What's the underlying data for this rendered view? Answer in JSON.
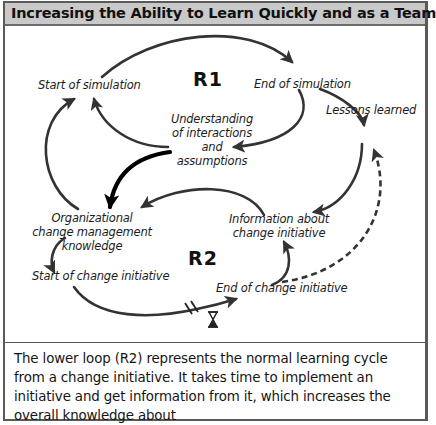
{
  "header": {
    "title": "Increasing the Ability to Learn Quickly and as a Team"
  },
  "diagram": {
    "loops": [
      {
        "id": "R1",
        "label": "R1",
        "type": "reinforcing"
      },
      {
        "id": "R2",
        "label": "R2",
        "type": "reinforcing"
      }
    ],
    "nodes": {
      "start_of_simulation": "Start of simulation",
      "end_of_simulation": "End of simulation",
      "understanding_line1": "Understanding",
      "understanding_line2": "of interactions",
      "understanding_line3": "and",
      "understanding_line4": "assumptions",
      "lessons_learned": "Lessons learned",
      "org_knowledge_line1": "Organizational",
      "org_knowledge_line2": "change management",
      "org_knowledge_line3": "knowledge",
      "information_line1": "Information about",
      "information_line2": "change initiative",
      "start_of_change": "Start of change initiative",
      "end_of_change": "End of change initiative"
    },
    "links": [
      {
        "from": "Start of simulation",
        "to": "End of simulation",
        "style": "solid"
      },
      {
        "from": "End of simulation",
        "to": "Understanding of interactions and assumptions",
        "style": "solid"
      },
      {
        "from": "Understanding of interactions and assumptions",
        "to": "Start of simulation",
        "style": "solid"
      },
      {
        "from": "End of simulation",
        "to": "Lessons learned",
        "style": "solid"
      },
      {
        "from": "Lessons learned",
        "to": "Information about change initiative",
        "style": "solid"
      },
      {
        "from": "Understanding of interactions and assumptions",
        "to": "Organizational change management knowledge",
        "style": "bold"
      },
      {
        "from": "Organizational change management knowledge",
        "to": "Start of simulation",
        "style": "solid"
      },
      {
        "from": "Information about change initiative",
        "to": "Organizational change management knowledge",
        "style": "solid"
      },
      {
        "from": "Organizational change management knowledge",
        "to": "Start of change initiative",
        "style": "solid"
      },
      {
        "from": "Start of change initiative",
        "to": "End of change initiative",
        "style": "solid",
        "delay": true
      },
      {
        "from": "End of change initiative",
        "to": "Information about change initiative",
        "style": "solid"
      },
      {
        "from": "End of change initiative",
        "to": "Lessons learned",
        "style": "dashed"
      }
    ],
    "delay_icon": "hourglass-icon",
    "colors": {
      "arrow": "#333333",
      "header_bg": "#c9c9c9",
      "border": "#5a5a5a"
    }
  },
  "caption": {
    "text": "The lower loop (R2) represents the normal learning cycle from a change initiative. It takes time to implement an initiative and get information from it, which increases the overall knowledge about"
  }
}
